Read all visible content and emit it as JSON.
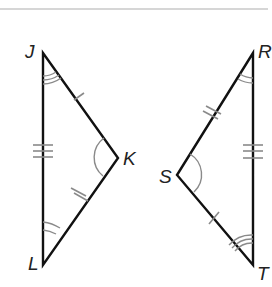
{
  "diagram": {
    "colors": {
      "background": "#ffffff",
      "divider": "#c8c8c8",
      "side": "#111111",
      "mark": "#8a8a8a",
      "label": "#222222"
    },
    "triangles": [
      {
        "name": "JKL",
        "vertices": {
          "J": {
            "label": "J",
            "x": 43,
            "y": 53
          },
          "K": {
            "label": "K",
            "x": 118,
            "y": 158
          },
          "L": {
            "label": "L",
            "x": 43,
            "y": 265
          }
        },
        "side_marks": {
          "JK": 1,
          "KL": 2,
          "JL": 3
        },
        "angle_marks": {
          "J": 3,
          "K": 1,
          "L": 2
        }
      },
      {
        "name": "RST",
        "vertices": {
          "R": {
            "label": "R",
            "x": 253,
            "y": 53
          },
          "S": {
            "label": "S",
            "x": 177,
            "y": 175
          },
          "T": {
            "label": "T",
            "x": 253,
            "y": 265
          }
        },
        "side_marks": {
          "ST": 1,
          "RS": 2,
          "RT": 3
        },
        "angle_marks": {
          "T": 3,
          "S": 1,
          "R": 2
        }
      }
    ]
  }
}
